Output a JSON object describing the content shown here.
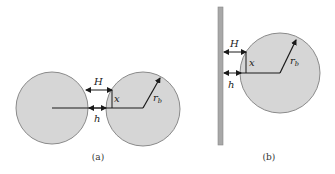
{
  "panels": {
    "a": {
      "caption": "(a)",
      "labels": {
        "H": "H",
        "x": "x",
        "h": "h",
        "r": "r",
        "r_sub": "b"
      }
    },
    "b": {
      "caption": "(b)",
      "labels": {
        "H": "H",
        "x": "x",
        "h": "h",
        "r": "r",
        "r_sub": "b"
      }
    }
  },
  "colors": {
    "sphere_fill": "#d6d6d6",
    "sphere_stroke": "#8a8a8a",
    "wall_fill": "#a8a8a8",
    "line": "#1a1a1a"
  }
}
